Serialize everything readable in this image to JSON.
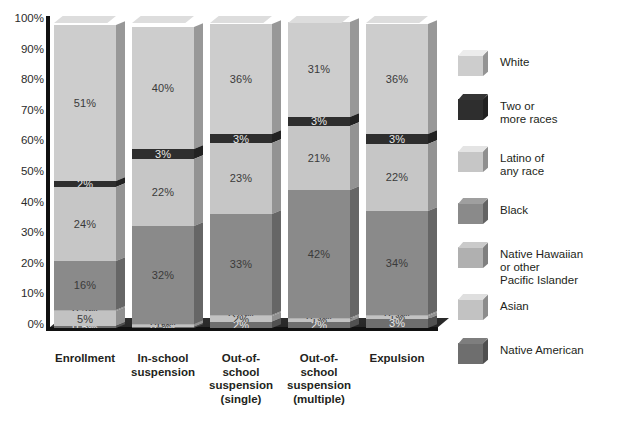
{
  "chart_data": {
    "type": "bar",
    "title": "",
    "subtitle": "",
    "xlabel": "",
    "ylabel": "",
    "ylim": [
      0,
      100
    ],
    "stacked": true,
    "stack_mode": "percent",
    "grid": false,
    "legend_position": "right",
    "y_ticks": [
      "0%",
      "10%",
      "20%",
      "30%",
      "40%",
      "50%",
      "60%",
      "70%",
      "80%",
      "90%",
      "100%"
    ],
    "y_tick_values": [
      0,
      10,
      20,
      30,
      40,
      50,
      60,
      70,
      80,
      90,
      100
    ],
    "categories": [
      "Enrollment",
      "In-school\nsuspension",
      "Out-of-\nschool\nsuspension\n(single)",
      "Out-of-\nschool\nsuspension\n(multiple)",
      "Expulsion"
    ],
    "series": [
      {
        "name": "Native American",
        "color": "#6e6e6e",
        "values": [
          0.5,
          0.2,
          2,
          2,
          3
        ],
        "labels": [
          "0.5%",
          "0.2%",
          "2%",
          "2%",
          "3%"
        ]
      },
      {
        "name": "Asian",
        "color": "#c2c2c2",
        "values": [
          5,
          1,
          2,
          1,
          1
        ],
        "labels": [
          "5%",
          "1%",
          "2%",
          "1%",
          "1%"
        ]
      },
      {
        "name": "Native Hawaiian or other Pacific Islander",
        "color": "#b0b0b0",
        "values": [
          0.5,
          0.2,
          0.4,
          0.3,
          0.3
        ],
        "labels": [
          "0.5%",
          "0.2%",
          "0.4%",
          "0.3%",
          "0.3%"
        ]
      },
      {
        "name": "Black",
        "color": "#8a8a8a",
        "values": [
          16,
          32,
          33,
          42,
          34
        ],
        "labels": [
          "16%",
          "32%",
          "33%",
          "42%",
          "34%"
        ]
      },
      {
        "name": "Latino of any race",
        "color": "#c6c6c6",
        "values": [
          24,
          22,
          23,
          21,
          22
        ],
        "labels": [
          "24%",
          "22%",
          "23%",
          "21%",
          "22%"
        ]
      },
      {
        "name": "Two or more races",
        "color": "#2e2e2e",
        "values": [
          2,
          3,
          3,
          3,
          3
        ],
        "labels": [
          "2%",
          "3%",
          "3%",
          "3%",
          "3%"
        ]
      },
      {
        "name": "White",
        "color": "#cdcdcd",
        "values": [
          51,
          40,
          36,
          31,
          36
        ],
        "labels": [
          "51%",
          "40%",
          "36%",
          "31%",
          "36%"
        ]
      }
    ],
    "legend": [
      {
        "label": "White",
        "color": "#cdcdcd"
      },
      {
        "label": "Two or\nmore races",
        "color": "#2e2e2e"
      },
      {
        "label": "Latino of\nany race",
        "color": "#c6c6c6"
      },
      {
        "label": "Black",
        "color": "#8a8a8a"
      },
      {
        "label": "Native Hawaiian\nor other\nPacific Islander",
        "color": "#b0b0b0"
      },
      {
        "label": "Asian",
        "color": "#c2c2c2"
      },
      {
        "label": "Native American",
        "color": "#6e6e6e"
      }
    ],
    "caption": ""
  }
}
